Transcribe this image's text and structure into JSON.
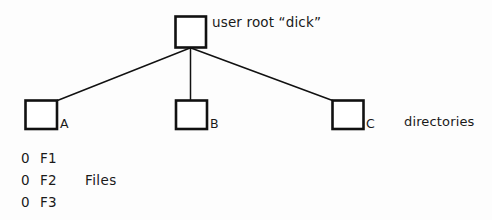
{
  "diagram": {
    "title_label": "user root “dick”",
    "side_label_directories": "directories",
    "nodes": [
      {
        "id": "root",
        "letter": "",
        "label": "user root “dick”"
      },
      {
        "id": "a",
        "letter": "A",
        "label": ""
      },
      {
        "id": "b",
        "letter": "B",
        "label": ""
      },
      {
        "id": "c",
        "letter": "C",
        "label": ""
      }
    ],
    "node_letters": {
      "a": "A",
      "b": "B",
      "c": "C"
    },
    "colors": {
      "background": "#fdfdfd",
      "stroke": "#111111",
      "box_fill": "#ffffff",
      "text": "#1a1a1a"
    }
  },
  "files": {
    "group_label": "Files",
    "rows": [
      {
        "marker": "0",
        "name": "F1",
        "group": ""
      },
      {
        "marker": "0",
        "name": "F2",
        "group": "Files"
      },
      {
        "marker": "0",
        "name": "F3",
        "group": ""
      }
    ]
  }
}
